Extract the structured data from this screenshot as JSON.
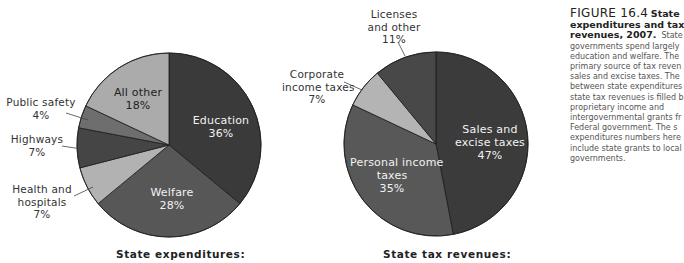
{
  "chart_data": [
    {
      "type": "pie",
      "title": "State expenditures:",
      "center": [
        169,
        145
      ],
      "radius": 92,
      "start_angle_deg": 0,
      "direction": "clockwise",
      "slices": [
        {
          "label": "Education",
          "value": 36,
          "display": "36%",
          "color": "#3a3a3a"
        },
        {
          "label": "Welfare",
          "value": 28,
          "display": "28%",
          "color": "#575757"
        },
        {
          "label": "Health and hospitals",
          "value": 7,
          "display": "7%",
          "color": "#b2b2b2"
        },
        {
          "label": "Highways",
          "value": 7,
          "display": "7%",
          "color": "#454545"
        },
        {
          "label": "Public safety",
          "value": 4,
          "display": "4%",
          "color": "#6e6e6e"
        },
        {
          "label": "All other",
          "value": 18,
          "display": "18%",
          "color": "#ababab"
        }
      ]
    },
    {
      "type": "pie",
      "title": "State tax revenues:",
      "center": [
        436,
        144
      ],
      "radius": 92,
      "start_angle_deg": 0,
      "direction": "clockwise",
      "slices": [
        {
          "label": "Sales and excise taxes",
          "value": 47,
          "display": "47%",
          "color": "#3b3b3b"
        },
        {
          "label": "Personal income taxes",
          "value": 35,
          "display": "35%",
          "color": "#585858"
        },
        {
          "label": "Corporate income taxes",
          "value": 7,
          "display": "7%",
          "color": "#b4b4b4"
        },
        {
          "label": "Licenses and other",
          "value": 11,
          "display": "11%",
          "color": "#484848"
        }
      ]
    }
  ],
  "labels": {
    "education": {
      "line1": "Education",
      "line2": "36%"
    },
    "welfare": {
      "line1": "Welfare",
      "line2": "28%"
    },
    "health": {
      "line1": "Health and",
      "line2": "hospitals",
      "line3": "7%"
    },
    "highways": {
      "line1": "Highways",
      "line2": "7%"
    },
    "public_safety": {
      "line1": "Public safety",
      "line2": "4%"
    },
    "all_other": {
      "line1": "All other",
      "line2": "18%"
    },
    "sales": {
      "line1": "Sales and",
      "line2": "excise taxes",
      "line3": "47%"
    },
    "personal": {
      "line1": "Personal income",
      "line2": "taxes",
      "line3": "35%"
    },
    "corporate": {
      "line1": "Corporate",
      "line2": "income taxes",
      "line3": "7%"
    },
    "licenses": {
      "line1": "Licenses",
      "line2": "and other",
      "line3": "11%"
    }
  },
  "captions": {
    "left": "State expenditures:",
    "right": "State tax revenues:"
  },
  "figure_caption": {
    "number": "FIGURE 16.4",
    "title_l1": "State",
    "title_l2": "expenditures and tax",
    "title_l3": "revenues, 2007.",
    "body": [
      "State",
      "governments spend largely",
      "education and welfare. The",
      "primary source of tax reven",
      "sales and excise taxes. The",
      "between state expenditures",
      "state tax revenues is filled b",
      "proprietary income and",
      "intergovernmental grants fr",
      "Federal government. The s",
      "expenditures numbers here",
      "include state grants to local",
      "governments."
    ]
  }
}
